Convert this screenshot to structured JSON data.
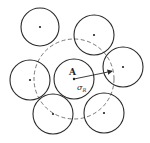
{
  "diagram": {
    "labels": {
      "center_point": "A",
      "radius_symbol": "σ",
      "radius_subscript": "R"
    },
    "colors": {
      "stroke": "#2a2a2a",
      "dashed": "#555555",
      "background": "#ffffff"
    },
    "central_particle": {
      "cx": 74,
      "cy": 79,
      "r": 20
    },
    "interaction_sphere": {
      "cx": 74,
      "cy": 79,
      "r": 40,
      "style": "dashed"
    },
    "neighbor_particles": [
      {
        "cx": 40,
        "cy": 27,
        "r": 19
      },
      {
        "cx": 94,
        "cy": 35,
        "r": 20
      },
      {
        "cx": 123,
        "cy": 67,
        "r": 20
      },
      {
        "cx": 30,
        "cy": 80,
        "r": 20
      },
      {
        "cx": 53,
        "cy": 114,
        "r": 20
      },
      {
        "cx": 104,
        "cy": 113,
        "r": 20
      }
    ],
    "radius_arrow": {
      "x1": 74,
      "y1": 79,
      "x2": 113,
      "y2": 71
    }
  }
}
